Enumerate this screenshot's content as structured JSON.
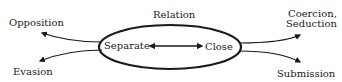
{
  "diagram": {
    "center_label": "Relation",
    "ellipse": {
      "left_node": "Separate",
      "right_node": "Close",
      "connector": "bidirectional-arrow"
    },
    "left_outcomes": [
      {
        "label": "Opposition",
        "position": "upper-left"
      },
      {
        "label": "Evasion",
        "position": "lower-left"
      }
    ],
    "right_outcomes": [
      {
        "label_line1": "Coercion,",
        "label_line2": "Seduction",
        "position": "upper-right"
      },
      {
        "label": "Submission",
        "position": "lower-right"
      }
    ],
    "colors": {
      "stroke": "#1a1a1a",
      "background": "#ffffff"
    }
  }
}
